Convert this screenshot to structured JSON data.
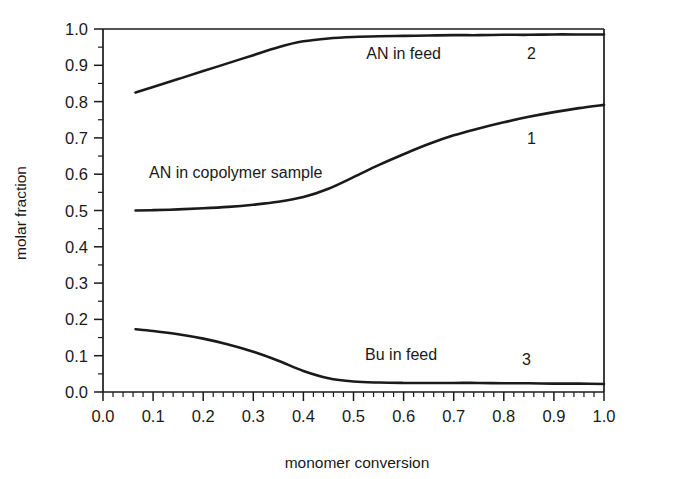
{
  "chart_data": {
    "type": "line",
    "title": "",
    "xlabel": "monomer conversion",
    "ylabel": "molar fraction",
    "xlim": [
      0.0,
      1.0
    ],
    "ylim": [
      0.0,
      1.0
    ],
    "grid": false,
    "legend_position": "inline-annotations",
    "x_ticks": [
      "0.0",
      "0.1",
      "0.2",
      "0.3",
      "0.4",
      "0.5",
      "0.6",
      "0.7",
      "0.8",
      "0.9",
      "1.0"
    ],
    "x_tick_values": [
      0.0,
      0.1,
      0.2,
      0.3,
      0.4,
      0.5,
      0.6,
      0.7,
      0.8,
      0.9,
      1.0
    ],
    "x_minor_step": 0.02,
    "y_ticks": [
      "0.0",
      "0.1",
      "0.2",
      "0.3",
      "0.4",
      "0.5",
      "0.6",
      "0.7",
      "0.8",
      "0.9",
      "1.0"
    ],
    "y_tick_values": [
      0.0,
      0.1,
      0.2,
      0.3,
      0.4,
      0.5,
      0.6,
      0.7,
      0.8,
      0.9,
      1.0
    ],
    "y_minor_step": 0.05,
    "line_color": "#1a1a1a",
    "x": [
      0.065,
      0.1,
      0.15,
      0.2,
      0.25,
      0.3,
      0.35,
      0.4,
      0.45,
      0.5,
      0.55,
      0.6,
      0.65,
      0.7,
      0.75,
      0.8,
      0.85,
      0.9,
      0.95,
      1.0
    ],
    "series": [
      {
        "name": "AN in copolymer sample",
        "curve_number": "1",
        "values": [
          0.5,
          0.501,
          0.503,
          0.506,
          0.51,
          0.516,
          0.524,
          0.537,
          0.56,
          0.592,
          0.625,
          0.655,
          0.683,
          0.707,
          0.726,
          0.743,
          0.758,
          0.771,
          0.782,
          0.791
        ]
      },
      {
        "name": "AN in feed",
        "curve_number": "2",
        "values": [
          0.825,
          0.84,
          0.862,
          0.884,
          0.906,
          0.928,
          0.95,
          0.966,
          0.974,
          0.978,
          0.98,
          0.981,
          0.982,
          0.983,
          0.983,
          0.984,
          0.984,
          0.985,
          0.985,
          0.985
        ]
      },
      {
        "name": "Bu in feed",
        "curve_number": "3",
        "values": [
          0.173,
          0.168,
          0.159,
          0.147,
          0.131,
          0.111,
          0.086,
          0.058,
          0.038,
          0.029,
          0.026,
          0.025,
          0.025,
          0.025,
          0.025,
          0.024,
          0.024,
          0.023,
          0.023,
          0.022
        ]
      }
    ],
    "annotations": [
      {
        "text": "AN in feed",
        "x": 0.6,
        "y": 0.935
      },
      {
        "text": "2",
        "x": 0.855,
        "y": 0.935
      },
      {
        "text": "AN in copolymer sample",
        "x": 0.265,
        "y": 0.605
      },
      {
        "text": "1",
        "x": 0.855,
        "y": 0.7
      },
      {
        "text": "Bu in feed",
        "x": 0.595,
        "y": 0.105
      },
      {
        "text": "3",
        "x": 0.845,
        "y": 0.09
      }
    ]
  }
}
